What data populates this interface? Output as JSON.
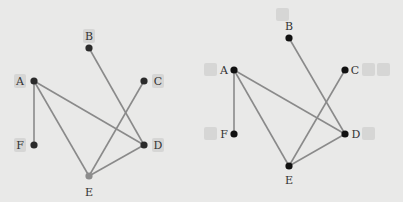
{
  "colors": {
    "background": "#e9e9e8",
    "edge": "#8a8a8a",
    "node_dark": "#2b2b2b",
    "node_black": "#111111",
    "node_highlight": "#8c8c8c",
    "label_box": "#d6d6d5"
  },
  "graphs": [
    {
      "name": "left-graph",
      "nodes": [
        {
          "id": "A",
          "label": "A",
          "x": 34,
          "y": 81,
          "label_x": 20,
          "label_y": 81,
          "box": true
        },
        {
          "id": "B",
          "label": "B",
          "x": 89,
          "y": 48,
          "label_x": 89,
          "label_y": 36,
          "box": true
        },
        {
          "id": "C",
          "label": "C",
          "x": 144,
          "y": 81,
          "label_x": 158,
          "label_y": 81,
          "box": true
        },
        {
          "id": "D",
          "label": "D",
          "x": 144,
          "y": 145,
          "label_x": 158,
          "label_y": 145,
          "box": true
        },
        {
          "id": "E",
          "label": "E",
          "x": 89,
          "y": 176,
          "label_x": 89,
          "label_y": 192,
          "box": false,
          "highlight": true
        },
        {
          "id": "F",
          "label": "F",
          "x": 34,
          "y": 145,
          "label_x": 20,
          "label_y": 145,
          "box": true
        }
      ],
      "edges": [
        [
          "A",
          "F"
        ],
        [
          "A",
          "D"
        ],
        [
          "A",
          "E"
        ],
        [
          "B",
          "D"
        ],
        [
          "C",
          "E"
        ],
        [
          "D",
          "E"
        ]
      ]
    },
    {
      "name": "right-graph",
      "nodes": [
        {
          "id": "A",
          "label": "A",
          "x": 234,
          "y": 70,
          "label_x": 224,
          "label_y": 70
        },
        {
          "id": "B",
          "label": "B",
          "x": 289,
          "y": 38,
          "label_x": 289,
          "label_y": 26
        },
        {
          "id": "C",
          "label": "C",
          "x": 345,
          "y": 70,
          "label_x": 355,
          "label_y": 70
        },
        {
          "id": "D",
          "label": "D",
          "x": 345,
          "y": 134,
          "label_x": 356,
          "label_y": 134
        },
        {
          "id": "E",
          "label": "E",
          "x": 289,
          "y": 166,
          "label_x": 289,
          "label_y": 180
        },
        {
          "id": "F",
          "label": "F",
          "x": 234,
          "y": 134,
          "label_x": 224,
          "label_y": 134
        }
      ],
      "edges": [
        [
          "A",
          "F"
        ],
        [
          "A",
          "D"
        ],
        [
          "A",
          "E"
        ],
        [
          "B",
          "D"
        ],
        [
          "C",
          "E"
        ],
        [
          "D",
          "E"
        ]
      ],
      "empty_boxes": [
        {
          "x": 276,
          "y": 8,
          "w": 13,
          "h": 13
        },
        {
          "x": 204,
          "y": 63,
          "w": 13,
          "h": 13
        },
        {
          "x": 362,
          "y": 63,
          "w": 13,
          "h": 13
        },
        {
          "x": 377,
          "y": 63,
          "w": 13,
          "h": 13
        },
        {
          "x": 204,
          "y": 127,
          "w": 13,
          "h": 13
        },
        {
          "x": 362,
          "y": 127,
          "w": 13,
          "h": 13
        }
      ]
    }
  ]
}
